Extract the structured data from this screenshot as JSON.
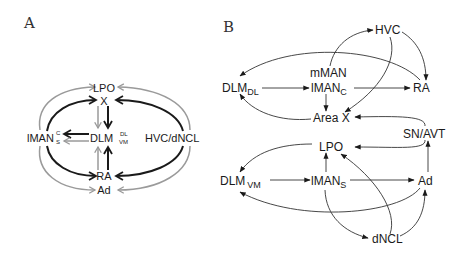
{
  "panels": {
    "a": {
      "label": "A",
      "nodes": {
        "lpo": "LPO",
        "x": "X",
        "iman": "lMAN",
        "iman_sup": "C",
        "iman_sub": "S",
        "dlm": "DLM",
        "dlm_sup": "DL",
        "dlm_sub": "VM",
        "hvc_dncl": "HVC/dNCL",
        "ra": "RA",
        "ad": "Ad"
      },
      "legend_colors": {
        "circuit_c": "#1a1a1a",
        "circuit_s": "#9a9a9a"
      },
      "edges": [
        {
          "from": "lMAN_C",
          "to": "X",
          "color": "black"
        },
        {
          "from": "HVC/dNCL",
          "to": "X",
          "color": "black"
        },
        {
          "from": "X",
          "to": "DLM",
          "color": "black"
        },
        {
          "from": "DLM",
          "to": "lMAN_C",
          "color": "black"
        },
        {
          "from": "lMAN_C",
          "to": "RA",
          "color": "black"
        },
        {
          "from": "HVC/dNCL",
          "to": "RA",
          "color": "black"
        },
        {
          "from": "RA",
          "to": "DLM",
          "color": "black"
        },
        {
          "from": "lMAN_S",
          "to": "LPO",
          "color": "gray"
        },
        {
          "from": "HVC/dNCL",
          "to": "LPO",
          "color": "gray"
        },
        {
          "from": "LPO",
          "to": "DLM",
          "color": "gray"
        },
        {
          "from": "DLM",
          "to": "lMAN_S",
          "color": "gray"
        },
        {
          "from": "lMAN_S",
          "to": "Ad",
          "color": "gray"
        },
        {
          "from": "HVC/dNCL",
          "to": "Ad",
          "color": "gray"
        },
        {
          "from": "Ad",
          "to": "DLM",
          "color": "gray"
        }
      ]
    },
    "b": {
      "label": "B",
      "nodes": {
        "hvc": "HVC",
        "mman": "mMAN",
        "dlm_dl": "DLM",
        "dlm_dl_sub": "DL",
        "iman_c": "lMAN",
        "iman_c_sub": "C",
        "ra": "RA",
        "area_x": "Area X",
        "sn_avt": "SN/AVT",
        "lpo": "LPO",
        "dlm_vm": "DLM",
        "dlm_vm_sub": "VM",
        "iman_s": "lMAN",
        "iman_s_sub": "S",
        "ad": "Ad",
        "dncl": "dNCL"
      },
      "edges": [
        {
          "from": "mMAN",
          "to": "HVC"
        },
        {
          "from": "HVC",
          "to": "RA"
        },
        {
          "from": "HVC",
          "to": "Area X"
        },
        {
          "from": "RA",
          "to": "DLM_DL"
        },
        {
          "from": "DLM_DL",
          "to": "lMAN_C"
        },
        {
          "from": "lMAN_C",
          "to": "RA"
        },
        {
          "from": "lMAN_C",
          "to": "Area X"
        },
        {
          "from": "Area X",
          "to": "DLM_DL"
        },
        {
          "from": "SN/AVT",
          "to": "Area X"
        },
        {
          "from": "SN/AVT",
          "to": "LPO"
        },
        {
          "from": "Ad",
          "to": "SN/AVT"
        },
        {
          "from": "LPO",
          "to": "DLM_VM"
        },
        {
          "from": "DLM_VM",
          "to": "lMAN_S"
        },
        {
          "from": "lMAN_S",
          "to": "LPO"
        },
        {
          "from": "lMAN_S",
          "to": "Ad"
        },
        {
          "from": "Ad",
          "to": "DLM_VM"
        },
        {
          "from": "lMAN_S",
          "to": "dNCL"
        },
        {
          "from": "dNCL",
          "to": "LPO"
        },
        {
          "from": "dNCL",
          "to": "Ad"
        }
      ]
    }
  }
}
